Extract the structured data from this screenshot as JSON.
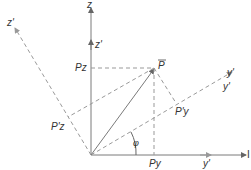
{
  "diagram": {
    "title": "",
    "colors": {
      "axis": "#7a7a7a",
      "dashed": "#9a9a9a",
      "text": "#333333"
    },
    "labels": {
      "z": "z",
      "z_prime_small": "z'",
      "z_prime_axis": "z'",
      "y": "I",
      "y_prime_small": "y'",
      "y_prime_axis_a": "y'",
      "y_prime_axis_b": "y'",
      "P": "P",
      "Pz": "Pz",
      "Py": "Py",
      "P_prime_y": "P'y",
      "P_prime_z": "P'z",
      "phi": "φ"
    }
  }
}
